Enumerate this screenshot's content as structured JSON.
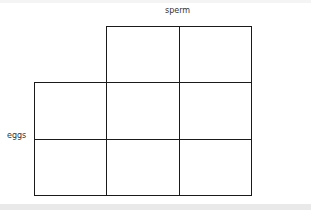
{
  "labels": {
    "top": "sperm",
    "left": "eggs"
  },
  "grid": {
    "rows": 3,
    "cols": 3,
    "missing_cells": [
      [
        0,
        0
      ]
    ],
    "cells": [
      [
        "",
        "",
        ""
      ],
      [
        "",
        "",
        ""
      ],
      [
        "",
        "",
        ""
      ]
    ]
  }
}
